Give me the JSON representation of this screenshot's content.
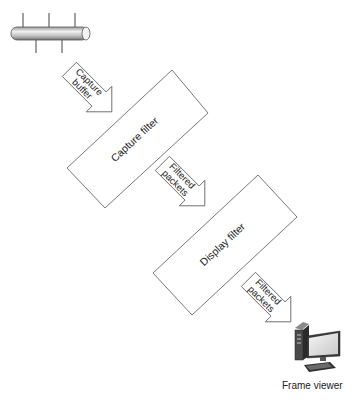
{
  "diagram": {
    "source": {
      "name": "network-cable"
    },
    "arrows": [
      {
        "line1": "Capture",
        "line2": "buffer"
      },
      {
        "line1": "Filtered",
        "line2": "packets"
      },
      {
        "line1": "Filtered",
        "line2": "packets"
      }
    ],
    "boxes": [
      {
        "label": "Capture filter"
      },
      {
        "label": "Display filter"
      }
    ],
    "sink": {
      "label": "Frame viewer"
    }
  },
  "colors": {
    "stroke": "#555555",
    "text": "#222222",
    "background": "#ffffff"
  }
}
